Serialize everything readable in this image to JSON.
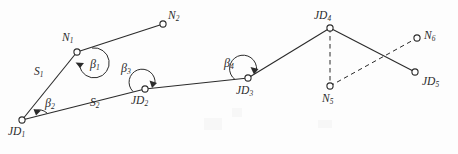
{
  "figure": {
    "background_color": "#fdfdfd",
    "line_color": "#2b2b2b",
    "node_fill": "#ffffff"
  },
  "nodes": [
    {
      "id": "JD1",
      "label": "JD",
      "sub": "1",
      "x": 22,
      "y": 120,
      "label_x": 8,
      "label_y": 126,
      "style": "solid"
    },
    {
      "id": "N1",
      "label": "N",
      "sub": "1",
      "x": 77,
      "y": 52,
      "label_x": 62,
      "label_y": 32,
      "style": "solid"
    },
    {
      "id": "N2",
      "label": "N",
      "sub": "2",
      "x": 163,
      "y": 24,
      "label_x": 168,
      "label_y": 10,
      "style": "solid"
    },
    {
      "id": "JD2",
      "label": "JD",
      "sub": "2",
      "x": 145,
      "y": 89,
      "label_x": 131,
      "label_y": 95,
      "style": "solid"
    },
    {
      "id": "JD3",
      "label": "JD",
      "sub": "3",
      "x": 248,
      "y": 78,
      "label_x": 236,
      "label_y": 85,
      "style": "solid"
    },
    {
      "id": "JD4",
      "label": "JD",
      "sub": "4",
      "x": 330,
      "y": 28,
      "label_x": 314,
      "label_y": 10,
      "style": "solid"
    },
    {
      "id": "N5",
      "label": "N",
      "sub": "5",
      "x": 330,
      "y": 86,
      "label_x": 322,
      "label_y": 93,
      "style": "solid"
    },
    {
      "id": "N6",
      "label": "N",
      "sub": "6",
      "x": 417,
      "y": 38,
      "label_x": 424,
      "label_y": 30,
      "style": "solid"
    },
    {
      "id": "JD5",
      "label": "JD",
      "sub": "5",
      "x": 415,
      "y": 72,
      "label_x": 422,
      "label_y": 76,
      "style": "solid"
    }
  ],
  "edges": [
    {
      "id": "JD1-N1",
      "from": "JD1",
      "to": "N1",
      "style": "solid"
    },
    {
      "id": "N1-N2",
      "from": "N1",
      "to": "N2",
      "style": "solid"
    },
    {
      "id": "JD1-JD2",
      "from": "JD1",
      "to": "JD2",
      "style": "solid"
    },
    {
      "id": "JD2-JD3",
      "from": "JD2",
      "to": "JD3",
      "style": "solid"
    },
    {
      "id": "JD3-JD4",
      "from": "JD3",
      "to": "JD4",
      "style": "solid"
    },
    {
      "id": "JD4-JD5",
      "from": "JD4",
      "to": "JD5",
      "style": "solid"
    },
    {
      "id": "JD4-N5",
      "from": "JD4",
      "to": "N5",
      "style": "dashed"
    },
    {
      "id": "N5-N6",
      "from": "N5",
      "to": "N6",
      "style": "dashed"
    }
  ],
  "segment_labels": [
    {
      "id": "S1",
      "label": "S",
      "sub": "1",
      "x": 34,
      "y": 66,
      "edge": "JD1-N1"
    },
    {
      "id": "S2",
      "label": "S",
      "sub": "2",
      "x": 90,
      "y": 97,
      "edge": "JD1-JD2"
    }
  ],
  "angle_labels": [
    {
      "id": "beta1",
      "label": "β",
      "sub": "1",
      "x": 90,
      "y": 58,
      "vertex": "N1"
    },
    {
      "id": "beta2",
      "label": "β",
      "sub": "2",
      "x": 45,
      "y": 97,
      "vertex": "JD1"
    },
    {
      "id": "beta3",
      "label": "β",
      "sub": "3",
      "x": 121,
      "y": 62,
      "vertex": "JD2"
    },
    {
      "id": "beta4",
      "label": "β",
      "sub": "4",
      "x": 224,
      "y": 57,
      "vertex": "JD3"
    }
  ]
}
